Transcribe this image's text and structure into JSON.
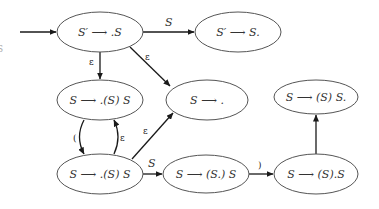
{
  "diagram": {
    "type": "NFA of LR(0) items",
    "left_edge_fragment": "S",
    "states": [
      {
        "id": "s0",
        "label": "S′ ⟶ .S",
        "cx": 100,
        "cy": 32,
        "rx": 43,
        "ry": 20
      },
      {
        "id": "s1",
        "label": "S′ ⟶ S.",
        "cx": 238,
        "cy": 32,
        "rx": 43,
        "ry": 20
      },
      {
        "id": "s2",
        "label": "S ⟶ .(S) S",
        "cx": 100,
        "cy": 100,
        "rx": 43,
        "ry": 20
      },
      {
        "id": "s3",
        "label": "S ⟶ .",
        "cx": 207,
        "cy": 100,
        "rx": 41,
        "ry": 20
      },
      {
        "id": "s4",
        "label": "S ⟶ (S) S.",
        "cx": 316,
        "cy": 97,
        "rx": 42,
        "ry": 17
      },
      {
        "id": "s5",
        "label": "S ⟶ .(S) S",
        "cx": 100,
        "cy": 174,
        "rx": 43,
        "ry": 20
      },
      {
        "id": "s6",
        "label": "S ⟶ (S.) S",
        "cx": 206,
        "cy": 174,
        "rx": 43,
        "ry": 19
      },
      {
        "id": "s7",
        "label": "S ⟶ (S).S",
        "cx": 316,
        "cy": 174,
        "rx": 42,
        "ry": 20
      }
    ],
    "edges": [
      {
        "from": "start",
        "to": "s0",
        "label": ""
      },
      {
        "from": "s0",
        "to": "s1",
        "label": "S"
      },
      {
        "from": "s0",
        "to": "s2",
        "label": "ε"
      },
      {
        "from": "s0",
        "to": "s3",
        "label": "ε"
      },
      {
        "from": "s2",
        "to": "s5",
        "label": "("
      },
      {
        "from": "s5",
        "to": "s2",
        "label": "ε"
      },
      {
        "from": "s5",
        "to": "s3",
        "label": "ε"
      },
      {
        "from": "s5",
        "to": "s6",
        "label": "S"
      },
      {
        "from": "s6",
        "to": "s7",
        "label": ")"
      },
      {
        "from": "s7",
        "to": "s4",
        "label": ""
      }
    ]
  }
}
